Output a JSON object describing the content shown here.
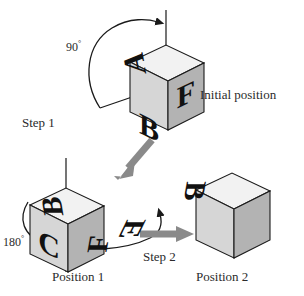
{
  "figure": {
    "type": "instructional-diagram",
    "background_color": "#ffffff",
    "line_color": "#1a1a1a",
    "arrow_gray": "#8a8a8a",
    "face_colors": {
      "top": "#f2f2f2",
      "left": "#d6d6d6",
      "right": "#b3b3b3",
      "letter": "#111111"
    }
  },
  "labels": {
    "initial_position": "Initial position",
    "step_1": "Step 1",
    "step_2": "Step 2",
    "position_1": "Position 1",
    "position_2": "Position 2",
    "angle_90_value": "90",
    "angle_90_unit": "°",
    "angle_180_value": "180",
    "angle_180_unit": "°"
  },
  "cubes": [
    {
      "id": "cube-initial",
      "caption": "Initial position",
      "faces": {
        "top": "A",
        "left": "B",
        "right": "F"
      }
    },
    {
      "id": "cube-position-1",
      "caption": "Position 1",
      "faces": {
        "top": "B",
        "left": "C",
        "right": "F"
      }
    },
    {
      "id": "cube-position-2",
      "caption": "Position 2",
      "faces": {
        "top": "B",
        "left": "A",
        "right": "E"
      }
    }
  ],
  "annotations": {
    "rotation_1": {
      "label": "90°",
      "axis": "vertical",
      "step": "Step 1"
    },
    "rotation_2": {
      "label": "180°",
      "axis": "vertical",
      "step": "Step 2"
    }
  }
}
